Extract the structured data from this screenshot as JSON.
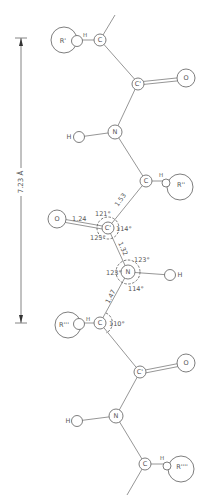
{
  "figure": {
    "type": "polypeptide chain (extended beta-strand) diagram",
    "dimension": {
      "label": "7.23 Å",
      "from_atom": "Cα (residue 1)",
      "to_atom": "Cα (residue 3)"
    },
    "residues": [
      {
        "side_chain": "R'",
        "atoms": {
          "alpha_carbon": "C",
          "hydrogen": "H"
        }
      },
      {
        "side_chain": "R''",
        "atoms": {
          "alpha_carbon": "C",
          "hydrogen": "H"
        }
      },
      {
        "side_chain": "R'''",
        "atoms": {
          "alpha_carbon": "C",
          "hydrogen": "H"
        }
      },
      {
        "side_chain": "R''''",
        "atoms": {
          "alpha_carbon": "C",
          "hydrogen": "H"
        }
      }
    ],
    "atom_labels": {
      "carbon": "C",
      "carbonyl_carbon": "C'",
      "nitrogen": "N",
      "oxygen": "O",
      "hydrogen": "H",
      "r1": "R'",
      "r2": "R''",
      "r3": "R'''",
      "r4": "R''''"
    },
    "bond_lengths": {
      "c_alpha_to_c_prime": "1.53",
      "c_prime_to_o": "1.24",
      "c_prime_to_n": "1.32",
      "n_to_c_alpha": "1.47"
    },
    "bond_angles": {
      "calpha_cprime_o": "121°",
      "calpha_cprime_n": "114°",
      "o_cprime_n": "125°",
      "cprime_n_h": "123°",
      "cprime_n_calpha": "123°",
      "calpha_n_h": "114°",
      "n_calpha_cprime": "110°"
    },
    "caption": ""
  }
}
